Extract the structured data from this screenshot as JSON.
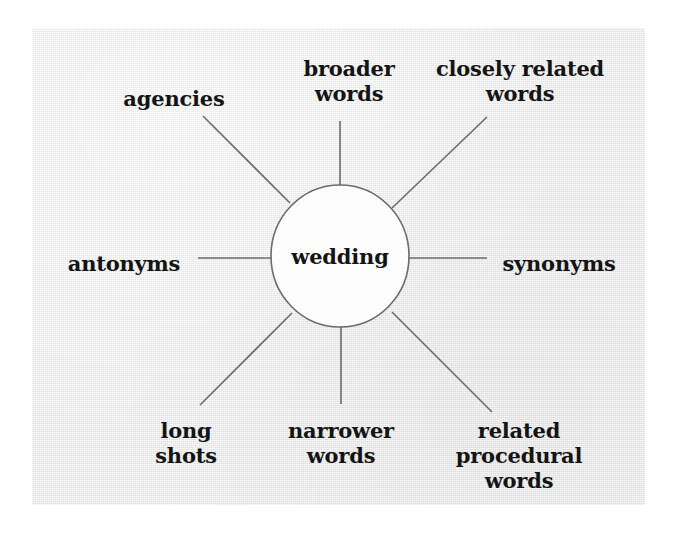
{
  "figure": {
    "type": "spider-web-diagram",
    "panel_background": "#e8e8e8",
    "page_background": "#ffffff",
    "line_color": "#6b6b6b",
    "text_color": "#141414",
    "node_fill": "#fdfdfd",
    "node_stroke": "#6b6b6b"
  },
  "center": {
    "label": "wedding",
    "shape": "ellipse",
    "cx": 340,
    "cy": 256,
    "rx": 69,
    "ry": 71
  },
  "spokes": [
    {
      "id": "agencies",
      "label": "agencies",
      "lines": [
        "agencies"
      ],
      "label_x": 174,
      "label_y": 98,
      "align": "center",
      "line": {
        "x1": 203,
        "y1": 116,
        "x2": 290,
        "y2": 203
      }
    },
    {
      "id": "broader-words",
      "label": "broader words",
      "lines": [
        "broader",
        "words"
      ],
      "label_x": 349,
      "label_y": 81,
      "align": "center",
      "line": {
        "x1": 340,
        "y1": 121,
        "x2": 340,
        "y2": 185
      }
    },
    {
      "id": "closely-related-words",
      "label": "closely related words",
      "lines": [
        "closely related",
        "words"
      ],
      "label_x": 520,
      "label_y": 81,
      "align": "center",
      "line": {
        "x1": 487,
        "y1": 117,
        "x2": 392,
        "y2": 208
      }
    },
    {
      "id": "synonyms",
      "label": "synonyms",
      "lines": [
        "synonyms"
      ],
      "label_x": 559,
      "label_y": 263,
      "align": "left",
      "line": {
        "x1": 409,
        "y1": 258,
        "x2": 487,
        "y2": 258
      }
    },
    {
      "id": "related-procedural-words",
      "label": "related procedural words",
      "lines": [
        "related",
        "procedural",
        "words"
      ],
      "label_x": 519,
      "label_y": 455,
      "align": "center",
      "line": {
        "x1": 392,
        "y1": 312,
        "x2": 492,
        "y2": 412
      }
    },
    {
      "id": "narrower-words",
      "label": "narrower words",
      "lines": [
        "narrower",
        "words"
      ],
      "label_x": 341,
      "label_y": 443,
      "align": "center",
      "line": {
        "x1": 341,
        "y1": 327,
        "x2": 341,
        "y2": 404
      }
    },
    {
      "id": "long-shots",
      "label": "long shots",
      "lines": [
        "long",
        "shots"
      ],
      "label_x": 186,
      "label_y": 443,
      "align": "center",
      "line": {
        "x1": 292,
        "y1": 313,
        "x2": 200,
        "y2": 405
      }
    },
    {
      "id": "antonyms",
      "label": "antonyms",
      "lines": [
        "antonyms"
      ],
      "label_x": 124,
      "label_y": 263,
      "align": "right",
      "line": {
        "x1": 272,
        "y1": 258,
        "x2": 198,
        "y2": 258
      }
    }
  ]
}
